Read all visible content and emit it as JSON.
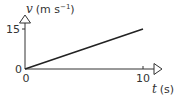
{
  "chart_data": {
    "type": "line",
    "title": "",
    "xlabel": "t (s)",
    "ylabel": "v (m s⁻¹)",
    "x_var": "t",
    "x_unit": "(s)",
    "y_var": "v",
    "y_unit_prefix": "(m s",
    "y_unit_sup": "−1",
    "y_unit_suffix": ")",
    "xlim": [
      0,
      10
    ],
    "ylim": [
      0,
      15
    ],
    "x_ticks": [
      "0",
      "10"
    ],
    "y_ticks": [
      "0",
      "15"
    ],
    "grid": false,
    "legend": null,
    "series": [
      {
        "name": "velocity",
        "x": [
          0,
          10
        ],
        "y": [
          0,
          15
        ],
        "color": "#222222"
      }
    ]
  },
  "colors": {
    "axis": "#333333",
    "line": "#222222",
    "text": "#333333"
  }
}
